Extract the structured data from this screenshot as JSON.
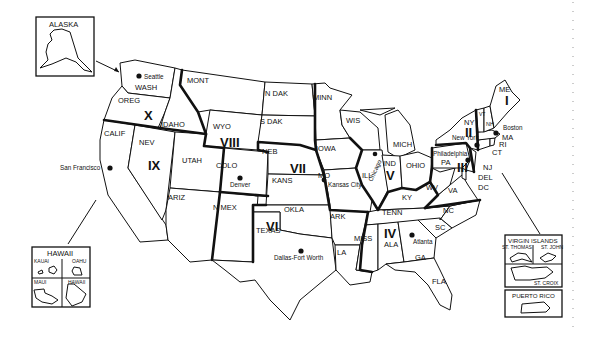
{
  "map": {
    "title": "U.S. Federal Regions",
    "insets": {
      "alaska": {
        "title": "ALASKA"
      },
      "hawaii": {
        "title": "HAWAII",
        "islands": [
          "KAUAI",
          "OAHU",
          "MAUI",
          "HAWAII"
        ]
      },
      "virgin_islands": {
        "title": "VIRGIN ISLANDS",
        "islands": [
          "ST. THOMAS",
          "ST. JOHN",
          "ST. CROIX"
        ]
      },
      "puerto_rico": {
        "title": "PUERTO RICO"
      }
    },
    "regions": [
      {
        "numeral": "I"
      },
      {
        "numeral": "II"
      },
      {
        "numeral": "III"
      },
      {
        "numeral": "IV"
      },
      {
        "numeral": "V"
      },
      {
        "numeral": "VI"
      },
      {
        "numeral": "VII"
      },
      {
        "numeral": "VIII"
      },
      {
        "numeral": "IX"
      },
      {
        "numeral": "X"
      }
    ],
    "states": {
      "wash": "WASH",
      "oreg": "OREG",
      "idaho": "IDAHO",
      "calif": "CALIF",
      "nev": "NEV",
      "utah": "UTAH",
      "ariz": "ARIZ",
      "mont": "MONT",
      "wyo": "WYO",
      "colo": "COLO",
      "nmex": "N MEX",
      "ndak": "N DAK",
      "sdak": "S DAK",
      "neb": "NEB",
      "kans": "KANS",
      "okla": "OKLA",
      "texas": "TEXAS",
      "minn": "MINN",
      "iowa": "IOWA",
      "mo": "MO",
      "ark": "ARK",
      "la": "LA",
      "wis": "WIS",
      "ill": "ILL",
      "mich": "MICH",
      "ind": "IND",
      "ohio": "OHIO",
      "ky": "KY",
      "tenn": "TENN",
      "miss": "MISS",
      "ala": "ALA",
      "ga": "GA",
      "fla": "FLA",
      "sc": "SC",
      "nc": "NC",
      "va": "VA",
      "wv": "WV",
      "pa": "PA",
      "ny": "NY",
      "nj": "NJ",
      "del": "DEL",
      "dc": "DC",
      "ct": "CT",
      "ri": "RI",
      "ma": "MA",
      "vt": "VT",
      "nh": "NH",
      "me": "ME"
    },
    "cities": {
      "seattle": "Seattle",
      "san_francisco": "San Francisco",
      "denver": "Denver",
      "kansas_city": "Kansas City",
      "dallas": "Dallas-Fort Worth",
      "chicago": "Chicago",
      "atlanta": "Atlanta",
      "philadelphia": "Philadelphia",
      "new_york": "New York",
      "boston": "Boston"
    }
  }
}
